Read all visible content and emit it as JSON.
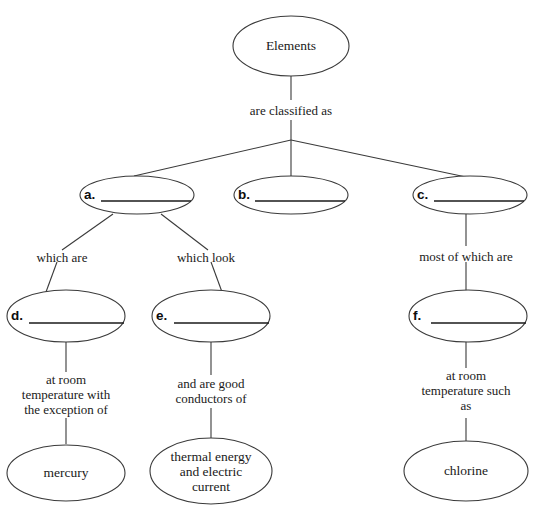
{
  "diagram": {
    "stroke_color": "#3a3a3a",
    "text_color": "#1a1a1a",
    "background_color": "#ffffff",
    "nodes": {
      "root": {
        "label": "Elements"
      },
      "blank_a": {
        "letter": "a."
      },
      "blank_b": {
        "letter": "b."
      },
      "blank_c": {
        "letter": "c."
      },
      "blank_d": {
        "letter": "d."
      },
      "blank_e": {
        "letter": "e."
      },
      "blank_f": {
        "letter": "f."
      },
      "mercury": {
        "label": "mercury"
      },
      "thermal": {
        "line1": "thermal energy",
        "line2": "and electric",
        "line3": "current"
      },
      "chlorine": {
        "label": "chlorine"
      }
    },
    "links": {
      "classified": {
        "label": "are classified as"
      },
      "which_are": {
        "label": "which are"
      },
      "which_look": {
        "label": "which look"
      },
      "most_of_which": {
        "label": "most of which are"
      },
      "room_temp_exception": {
        "line1": "at room",
        "line2": "temperature with",
        "line3": "the exception of"
      },
      "good_conductors": {
        "line1": "and are good",
        "line2": "conductors of"
      },
      "room_temp_such_as": {
        "line1": "at room",
        "line2": "temperature such",
        "line3": "as"
      }
    }
  }
}
